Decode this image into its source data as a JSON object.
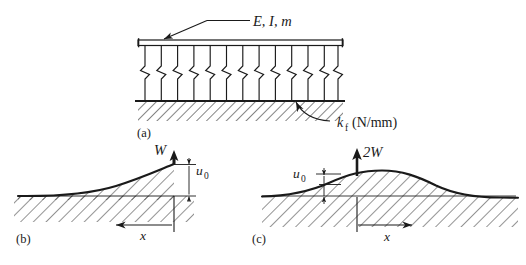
{
  "figure": {
    "background_color": "#ffffff",
    "line_color": "#1a1a1a"
  },
  "panels": [
    {
      "id": "a",
      "label": "(a)",
      "description": "Beam supported on a continuous elastic spring foundation over hatched rigid ground",
      "annotations": [
        {
          "name": "beam-property-label",
          "text": "E, I, m",
          "style": "italic",
          "leader": "arrow-to-beam"
        },
        {
          "name": "foundation-stiffness-label",
          "text": "k",
          "subscript": "f",
          "units": "(N/mm)",
          "full_text": "kf (N/mm)",
          "leader": "curved-arrow-to-spring"
        }
      ],
      "spring_count": 13
    },
    {
      "id": "b",
      "label": "(b)",
      "description": "Semi-infinite beam: concentrated end load, deflection decaying away from the end",
      "annotations": [
        {
          "name": "load-label",
          "text": "W",
          "style": "italic",
          "arrow": "up"
        },
        {
          "name": "deflection-label",
          "text": "u",
          "subscript": "0",
          "full_text": "u0",
          "position": "right-of-dimension"
        },
        {
          "name": "axis-label-x",
          "text": "x",
          "style": "italic",
          "arrow": "left"
        }
      ]
    },
    {
      "id": "c",
      "label": "(c)",
      "description": "Infinite beam: central concentrated load, symmetric deflection bump",
      "annotations": [
        {
          "name": "load-label",
          "text": "2W",
          "style": "italic",
          "arrow": "up"
        },
        {
          "name": "deflection-label",
          "text": "u",
          "subscript": "0",
          "full_text": "u0",
          "position": "left-of-dimension"
        },
        {
          "name": "axis-label-x",
          "text": "x",
          "style": "italic",
          "arrow": "right"
        }
      ]
    }
  ],
  "labels": {
    "beam_props": "E, I, m",
    "stiffness_symbol": "k",
    "stiffness_sub": "f",
    "stiffness_units": "(N/mm)",
    "load_b": "W",
    "load_c": "2W",
    "deflection_symbol": "u",
    "deflection_sub": "0",
    "axis_x": "x",
    "panel_a": "(a)",
    "panel_b": "(b)",
    "panel_c": "(c)"
  }
}
